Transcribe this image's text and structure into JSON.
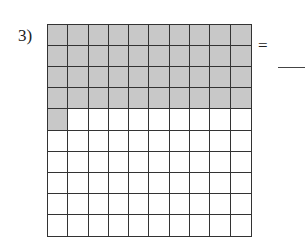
{
  "problem": {
    "number_label": "3)",
    "equals_sign": "=",
    "answer": "",
    "grid": {
      "rows": 10,
      "columns": 10,
      "shaded_count": 41,
      "shaded_color": "#c8c8c8",
      "unshaded_color": "#ffffff"
    }
  }
}
